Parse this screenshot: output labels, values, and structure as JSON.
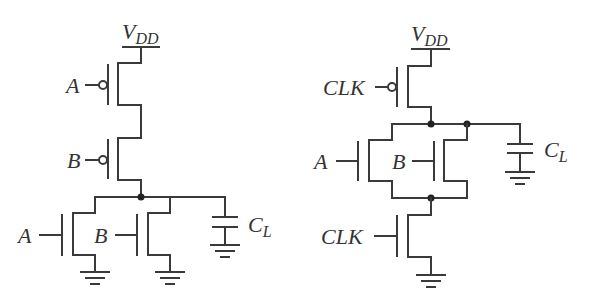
{
  "diagram": {
    "left_circuit": {
      "supply_label": "V",
      "supply_sub": "DD",
      "pmos_inputs": [
        "A",
        "B"
      ],
      "nmos_inputs": [
        "A",
        "B"
      ],
      "load_label": "C",
      "load_sub": "L"
    },
    "right_circuit": {
      "supply_label": "V",
      "supply_sub": "DD",
      "precharge_input": "CLK",
      "nmos_inputs": [
        "A",
        "B"
      ],
      "evaluate_input": "CLK",
      "load_label": "C",
      "load_sub": "L"
    },
    "colors": {
      "wire": "#3a3a3a",
      "background": "#ffffff"
    }
  }
}
